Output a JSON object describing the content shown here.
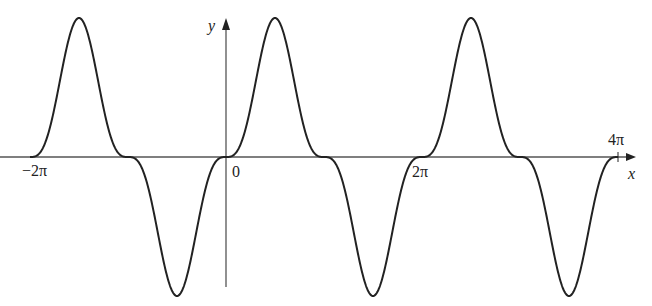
{
  "chart_data": {
    "type": "line",
    "title": "",
    "xlabel": "x",
    "ylabel": "y",
    "function_shape": "periodic, flattened at zeros (sin^3-like)",
    "x_range_radians": [
      -6.2832,
      12.5664
    ],
    "tick_labels": [
      "-2π",
      "0",
      "2π",
      "4π"
    ],
    "tick_values": [
      -6.2832,
      0,
      6.2832,
      12.5664
    ],
    "period": "2π",
    "peaks_x": [
      "-3π/2",
      "π/2",
      "5π/2"
    ],
    "troughs_x": [
      "-π/2",
      "3π/2",
      "7π/2"
    ],
    "zeros_x": [
      "-2π",
      "-π",
      "0",
      "π",
      "2π",
      "3π",
      "4π"
    ],
    "amplitude": 1,
    "grid": false,
    "legend": null
  },
  "labels": {
    "y_axis": "y",
    "x_axis": "x",
    "origin": "0",
    "neg_two_pi": "−2π",
    "two_pi": "2π",
    "four_pi": "4π"
  },
  "colors": {
    "curve": "#222222",
    "axes": "#555555"
  }
}
